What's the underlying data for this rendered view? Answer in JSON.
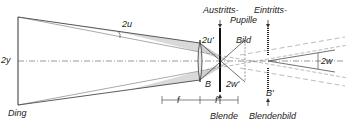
{
  "diagram": {
    "type": "optical ray diagram (telescope / magnifier: stop, pupils, image)",
    "labels": {
      "object_size": "2y",
      "object": "Ding",
      "object_angle": "2u",
      "image_angle": "2u'",
      "image": "Bild",
      "exit_pupil": "Austritts-",
      "exit_pupil_2": "Pupille",
      "entrance_pupil": "Eintritts-",
      "stop_point": "B",
      "field_angle_image": "2w'",
      "field_angle": "2w",
      "stop_image_point": "B'",
      "focal_length": "f",
      "focal_length_image": "f'",
      "stop": "Blende",
      "stop_image": "Blendenbild"
    },
    "colors": {
      "line": "#333333",
      "shade": "#d4d4d4",
      "background": "#ffffff"
    }
  }
}
